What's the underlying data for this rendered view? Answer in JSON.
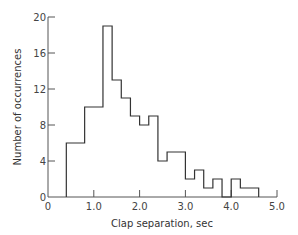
{
  "chart_data": {
    "type": "bar",
    "subtype": "histogram",
    "title": "",
    "xlabel": "Clap separation, sec",
    "ylabel": "Number of occurrences",
    "xlim": [
      0,
      5.0
    ],
    "ylim": [
      0,
      20
    ],
    "x_ticks": [
      "0",
      "1.0",
      "2.0",
      "3.0",
      "4.0",
      "5.0"
    ],
    "y_ticks": [
      "0",
      "4",
      "8",
      "12",
      "16",
      "20"
    ],
    "grid": false,
    "legend": null,
    "bins": [
      {
        "start": 0.4,
        "end": 0.8,
        "count": 6
      },
      {
        "start": 0.8,
        "end": 1.2,
        "count": 10
      },
      {
        "start": 1.2,
        "end": 1.4,
        "count": 19
      },
      {
        "start": 1.4,
        "end": 1.6,
        "count": 13
      },
      {
        "start": 1.6,
        "end": 1.8,
        "count": 11
      },
      {
        "start": 1.8,
        "end": 2.0,
        "count": 9
      },
      {
        "start": 2.0,
        "end": 2.2,
        "count": 8
      },
      {
        "start": 2.2,
        "end": 2.4,
        "count": 9
      },
      {
        "start": 2.4,
        "end": 2.6,
        "count": 4
      },
      {
        "start": 2.6,
        "end": 3.0,
        "count": 5
      },
      {
        "start": 3.0,
        "end": 3.2,
        "count": 2
      },
      {
        "start": 3.2,
        "end": 3.4,
        "count": 3
      },
      {
        "start": 3.4,
        "end": 3.6,
        "count": 1
      },
      {
        "start": 3.6,
        "end": 3.8,
        "count": 2
      },
      {
        "start": 3.8,
        "end": 4.0,
        "count": 0
      },
      {
        "start": 4.0,
        "end": 4.2,
        "count": 2
      },
      {
        "start": 4.2,
        "end": 4.6,
        "count": 1
      }
    ]
  },
  "colors": {
    "line": "#333333",
    "axis": "#555555"
  }
}
